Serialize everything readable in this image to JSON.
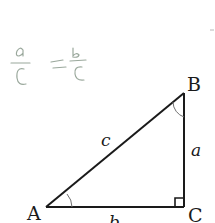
{
  "annotation": {
    "handwritten_equation": "a/c = b/c",
    "left_numerator": "a",
    "left_denominator": "c",
    "equals": "=",
    "right_numerator": "b",
    "right_denominator": "c",
    "color": "#9aa89c"
  },
  "triangle": {
    "type": "right triangle",
    "right_angle_at": "C",
    "vertices": {
      "A": "A",
      "B": "B",
      "C": "C"
    },
    "sides": {
      "hypotenuse": "c",
      "vertical": "a",
      "horizontal": "b"
    },
    "angle_marks": [
      "A",
      "B"
    ],
    "stroke_color": "#1a1a1a"
  }
}
